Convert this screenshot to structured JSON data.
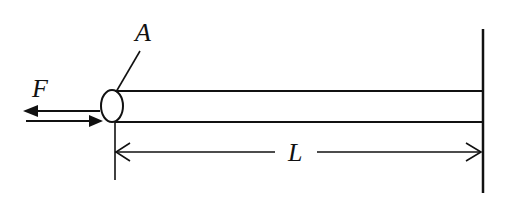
{
  "diagram": {
    "type": "mechanics-beam",
    "labels": {
      "force": "F",
      "point": "A",
      "length": "L"
    },
    "colors": {
      "stroke": "#111111",
      "background": "#ffffff"
    }
  }
}
